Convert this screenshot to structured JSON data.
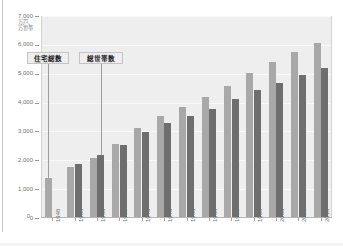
{
  "chart_data": {
    "type": "bar",
    "title": "",
    "xlabel": "",
    "ylabel": "",
    "unit_label_line1": "万戸、",
    "unit_label_line2": "万世帯",
    "ylim": [
      0,
      7000
    ],
    "yticks": [
      "0",
      "1,000",
      "2,000",
      "3,000",
      "4,000",
      "5,000",
      "6,000",
      "7,000"
    ],
    "ytick_values": [
      0,
      1000,
      2000,
      3000,
      4000,
      5000,
      6000,
      7000
    ],
    "grid": true,
    "legend_position": "annotation-callouts",
    "categories": [
      "1948",
      "1958",
      "1963",
      "1968",
      "1973",
      "1978",
      "1983",
      "1988",
      "1993",
      "1998",
      "2003",
      "2008",
      "2013"
    ],
    "series": [
      {
        "name": "住宅総数",
        "color": "#a8a8a8",
        "values": [
          1400,
          1780,
          2090,
          2560,
          3110,
          3550,
          3860,
          4200,
          4590,
          5030,
          5390,
          5760,
          6060
        ]
      },
      {
        "name": "総世帯数",
        "color": "#6e6e6e",
        "values": [
          null,
          1860,
          2180,
          2530,
          2970,
          3280,
          3520,
          3780,
          4110,
          4420,
          4690,
          4970,
          5210
        ]
      }
    ],
    "annotations": [
      {
        "text": "住宅総数",
        "target_category": "1948",
        "target_series": "住宅総数"
      },
      {
        "text": "総世帯数",
        "target_category": "1963",
        "target_series": "総世帯数"
      }
    ]
  },
  "colors": {
    "panel": "#eeeeee",
    "page": "#ffffff",
    "series_light": "#a8a8a8",
    "series_dark": "#6e6e6e",
    "axis": "#b5b5b5",
    "text": "#6f6f6f"
  }
}
